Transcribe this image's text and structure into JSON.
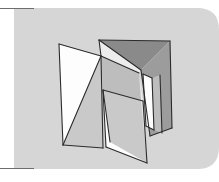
{
  "figure": {
    "caption": "",
    "canvas": {
      "width": 219,
      "height": 182
    },
    "colors": {
      "page_background": "#ffffff",
      "panel_background": "#d6d6d6",
      "panel_background_edge": "#cfcfcf",
      "rule_line": "#6d6d6d",
      "outline": "#2b2b2b",
      "face_white": "#fdfdfd",
      "face_light": "#ececec",
      "face_mid": "#c9c9c9",
      "face_shade": "#bdbdbd",
      "face_dark": "#9c9c9c",
      "face_darkest": "#8a8a8a"
    },
    "panel": {
      "x": 14,
      "y": 8,
      "width": 205,
      "height": 161,
      "corner_radius_top_right": 22,
      "corner_radius_bottom_right": 22
    },
    "rules": [
      {
        "name": "top-rule",
        "x1": 0,
        "y1": 8.5,
        "x2": 34,
        "y2": 8.5
      },
      {
        "name": "bottom-rule",
        "x1": 0,
        "y1": 168.5,
        "x2": 34,
        "y2": 168.5
      }
    ],
    "shape": {
      "name": "folded-paper-polyhedron",
      "description": "Three connected quadrilateral panels folded like a zig-zag screen, shaded in grayscale",
      "faces": [
        {
          "name": "left-outer-white-panel",
          "fill": "face_white",
          "points": "59,44 101,56 103,148 63,145"
        },
        {
          "name": "left-inner-shaded-triangle",
          "fill": "face_mid",
          "points": "101,56 103,148 63,145"
        },
        {
          "name": "center-top-light-wing",
          "fill": "face_light",
          "points": "99,40 170,41 139,73 101,56"
        },
        {
          "name": "center-top-dark-wing",
          "fill": "face_darkest",
          "points": "99,40 170,41 141,70"
        },
        {
          "name": "center-mid-shade-band",
          "fill": "face_shade",
          "points": "101,56 139,73 143,101 103,90"
        },
        {
          "name": "center-main-gray-face",
          "fill": "face_mid",
          "points": "103,90 143,101 147,163 106,147"
        },
        {
          "name": "center-lower-white-face",
          "fill": "face_white",
          "points": "103,90 106,147 147,163 110,142"
        },
        {
          "name": "center-fold-sliver",
          "fill": "face_light",
          "points": "139,73 143,101 147,163 141,100"
        },
        {
          "name": "right-dark-panel",
          "fill": "face_dark",
          "points": "141,70 170,41 172,128 150,136"
        },
        {
          "name": "right-white-wedge",
          "fill": "face_white",
          "points": "143,74 152,78 154,130 146,126"
        },
        {
          "name": "right-shadow-strip",
          "fill": "face_shade",
          "points": "152,78 160,75 162,133 154,130"
        }
      ],
      "edges": [
        {
          "name": "edge-left-top",
          "points": "59,44 101,56"
        },
        {
          "name": "edge-left-side",
          "points": "59,44 63,145"
        },
        {
          "name": "edge-left-bottom",
          "points": "63,145 103,148"
        },
        {
          "name": "edge-left-diagonal",
          "points": "63,145 101,56"
        },
        {
          "name": "edge-left-fold",
          "points": "101,56 103,148"
        },
        {
          "name": "edge-center-top-left",
          "points": "99,40 101,56"
        },
        {
          "name": "edge-center-top-ridge",
          "points": "99,40 170,41"
        },
        {
          "name": "edge-center-top-fold",
          "points": "101,56 139,73"
        },
        {
          "name": "edge-center-wing-fold",
          "points": "99,40 141,70"
        },
        {
          "name": "edge-center-diagonal",
          "points": "103,90 143,101"
        },
        {
          "name": "edge-center-main-left",
          "points": "103,90 106,147"
        },
        {
          "name": "edge-center-bottom",
          "points": "106,147 147,163"
        },
        {
          "name": "edge-center-right-fold",
          "points": "143,101 147,163"
        },
        {
          "name": "edge-center-inner-diag",
          "points": "110,142 103,90"
        },
        {
          "name": "edge-right-top",
          "points": "170,41 172,128"
        },
        {
          "name": "edge-right-fold",
          "points": "141,70 150,136"
        },
        {
          "name": "edge-right-bottom",
          "points": "150,136 172,128"
        },
        {
          "name": "edge-right-wedge-left",
          "points": "143,74 146,126"
        },
        {
          "name": "edge-right-wedge-right",
          "points": "152,78 154,130"
        },
        {
          "name": "edge-right-wedge-top",
          "points": "143,74 152,78"
        },
        {
          "name": "edge-right-wedge-bottom",
          "points": "146,126 154,130"
        },
        {
          "name": "edge-right-inner",
          "points": "160,75 162,133"
        }
      ]
    }
  }
}
